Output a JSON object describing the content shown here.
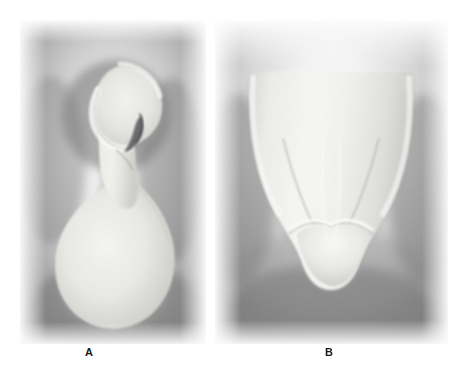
{
  "figure": {
    "kind": "radiograph-figure",
    "background_color": "#ffffff",
    "width": 467,
    "height": 372,
    "panel_count": 2
  },
  "panels": [
    {
      "id": "panel-a",
      "label": "A",
      "view": "proximal",
      "description": "Radiograph of a single-rooted tooth, proximal (lateral) view",
      "frame": {
        "x": 20,
        "y": 20,
        "width": 186,
        "height": 324
      },
      "film_base_color": "#b4b4b4",
      "halo_color": "#7d7d7d",
      "tooth_color": "#e8e8e4",
      "enamel_color": "#f4f4f1",
      "canal_color": "#4a4a4a",
      "features": [
        {
          "name": "crown",
          "position": "superior"
        },
        {
          "name": "cervical-constriction",
          "position": "mid-superior"
        },
        {
          "name": "root-bulb",
          "position": "inferior"
        },
        {
          "name": "pulp-canal-shadow",
          "position": "crown-right"
        }
      ]
    },
    {
      "id": "panel-b",
      "label": "B",
      "view": "facial",
      "description": "Radiograph of the same tooth, facial (labial) view with root canal visible as dark vertical line",
      "frame": {
        "x": 215,
        "y": 20,
        "width": 233,
        "height": 324
      },
      "film_base_color": "#bdbdbd",
      "halo_color": "#8a8a8a",
      "tooth_color": "#ececea",
      "enamel_color": "#f8f8f6",
      "canal_color": "#3c3c3c",
      "features": [
        {
          "name": "root-body",
          "position": "superior"
        },
        {
          "name": "root-canal",
          "position": "center-vertical"
        },
        {
          "name": "cemento-enamel-junction",
          "position": "inferior"
        },
        {
          "name": "crown-tip",
          "position": "inferior"
        }
      ]
    }
  ],
  "labels": {
    "panel_a": "A",
    "panel_b": "B",
    "font_weight": "bold",
    "color": "#1a1a1a"
  }
}
